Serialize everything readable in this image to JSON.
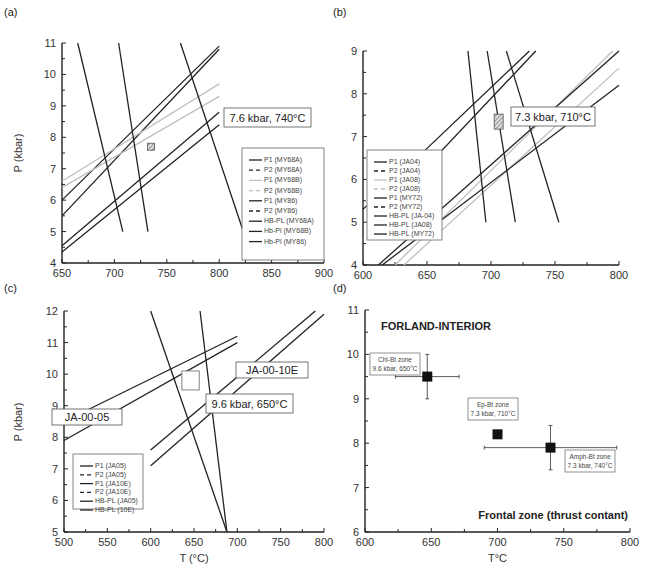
{
  "chart_data": [
    {
      "id": "a",
      "panel_label": "(a)",
      "type": "line",
      "xlabel": "",
      "ylabel": "P (kbar)",
      "xlim": [
        650,
        900
      ],
      "ylim": [
        4,
        11
      ],
      "xticks": [
        "650",
        "700",
        "750",
        "800",
        "850",
        "900"
      ],
      "yticks": [
        "4",
        "5",
        "6",
        "7",
        "8",
        "9",
        "10",
        "11"
      ],
      "annotation": "7.6 kbar, 740°C",
      "estimate_box": {
        "x": 735,
        "y": 7.7,
        "style": "hatched"
      },
      "legend": [
        "P1 (MY68A)",
        "P2 (MY68A)",
        "P1 (MY68B)",
        "P2 (MY68B)",
        "P1 (MY86)",
        "P2 (MY86)",
        "HB-PL (MY68A)",
        "Hb-Pl (MY68B)",
        "Hb-Pl (MY86)"
      ],
      "series": [
        {
          "name": "P1 (MY68A)",
          "x": [
            650,
            800
          ],
          "y": [
            6.0,
            10.9
          ],
          "color": "#222222"
        },
        {
          "name": "P2 (MY68A)",
          "x": [
            650,
            800
          ],
          "y": [
            5.5,
            10.8
          ],
          "color": "#222222"
        },
        {
          "name": "P1 (MY68B)",
          "x": [
            650,
            800
          ],
          "y": [
            6.6,
            9.7
          ],
          "color": "#c0c0c0"
        },
        {
          "name": "P2 (MY68B)",
          "x": [
            650,
            800
          ],
          "y": [
            6.4,
            9.3
          ],
          "color": "#c0c0c0"
        },
        {
          "name": "P1 (MY86)",
          "x": [
            650,
            800
          ],
          "y": [
            4.55,
            8.8
          ],
          "color": "#222222"
        },
        {
          "name": "P2 (MY86)",
          "x": [
            650,
            800
          ],
          "y": [
            4.35,
            8.4
          ],
          "color": "#222222"
        },
        {
          "name": "HB-PL (MY68A)",
          "x": [
            665,
            708
          ],
          "y": [
            11,
            5
          ],
          "color": "#222222"
        },
        {
          "name": "Hb-Pl (MY68B)",
          "x": [
            704,
            732
          ],
          "y": [
            11,
            5
          ],
          "color": "#222222"
        },
        {
          "name": "Hb-Pl (MY86)",
          "x": [
            763,
            823
          ],
          "y": [
            11,
            5
          ],
          "color": "#222222"
        }
      ]
    },
    {
      "id": "b",
      "panel_label": "(b)",
      "type": "line",
      "xlabel": "",
      "ylabel": "",
      "xlim": [
        600,
        800
      ],
      "ylim": [
        4,
        9
      ],
      "xticks": [
        "600",
        "650",
        "700",
        "750",
        "800"
      ],
      "yticks": [
        "4",
        "5",
        "6",
        "7",
        "8",
        "9"
      ],
      "annotation": "7.3 kbar, 710°C",
      "estimate_box": {
        "x": 706,
        "y": 7.35,
        "style": "hatched"
      },
      "legend": [
        "P1 (JA04)",
        "P2 (JA04)",
        "P1 (JA08)",
        "P2 (JA08)",
        "P1 (MY72)",
        "P2 (MY72)",
        "HB-PL (JA-04)",
        "HB-PL (JA08)",
        "HB-PL (MY72)"
      ],
      "series": [
        {
          "name": "P1 (JA04)",
          "x": [
            600,
            730
          ],
          "y": [
            5.3,
            9.0
          ],
          "color": "#222222"
        },
        {
          "name": "P2 (JA04)",
          "x": [
            615,
            735
          ],
          "y": [
            5.2,
            9.0
          ],
          "color": "#222222"
        },
        {
          "name": "P1 (JA08)",
          "x": [
            625,
            795
          ],
          "y": [
            4.0,
            9.0
          ],
          "color": "#c0c0c0"
        },
        {
          "name": "P2 (JA08)",
          "x": [
            632,
            800
          ],
          "y": [
            4.0,
            8.6
          ],
          "color": "#c0c0c0"
        },
        {
          "name": "P1 (MY72)",
          "x": [
            612,
            800
          ],
          "y": [
            4.0,
            9.0
          ],
          "color": "#222222"
        },
        {
          "name": "P2 (MY72)",
          "x": [
            615,
            800
          ],
          "y": [
            4.0,
            8.2
          ],
          "color": "#222222"
        },
        {
          "name": "HB-PL (JA-04)",
          "x": [
            682,
            696
          ],
          "y": [
            9,
            5
          ],
          "color": "#222222"
        },
        {
          "name": "HB-PL (JA08)",
          "x": [
            697,
            719
          ],
          "y": [
            9,
            5
          ],
          "color": "#222222"
        },
        {
          "name": "HB-PL (MY72)",
          "x": [
            712,
            753
          ],
          "y": [
            9,
            5
          ],
          "color": "#222222"
        }
      ]
    },
    {
      "id": "c",
      "panel_label": "(c)",
      "type": "line",
      "xlabel": "T (°C)",
      "ylabel": "P (kbar)",
      "xlim": [
        500,
        800
      ],
      "ylim": [
        5,
        12
      ],
      "xticks": [
        "500",
        "550",
        "600",
        "650",
        "700",
        "750",
        "800"
      ],
      "yticks": [
        "5",
        "6",
        "7",
        "8",
        "9",
        "10",
        "11",
        "12"
      ],
      "annotation": "9.6 kbar, 650°C",
      "sample_labels": [
        "JA-00-05",
        "JA-00-10E"
      ],
      "estimate_box": {
        "x": [
          636,
          656
        ],
        "y": [
          9.5,
          10.1
        ],
        "style": "open"
      },
      "legend": [
        "P1 (JA05)",
        "P2 (JA05)",
        "P1 (JA10E)",
        "P2 (JA10E)",
        "HB-PL (JA05)",
        "HB-PL (10E)"
      ],
      "series": [
        {
          "name": "P1 (JA05)",
          "x": [
            500,
            700
          ],
          "y": [
            8.5,
            11.2
          ],
          "color": "#222222"
        },
        {
          "name": "P2 (JA05)",
          "x": [
            500,
            700
          ],
          "y": [
            7.9,
            11.0
          ],
          "color": "#222222"
        },
        {
          "name": "P1 (JA10E)",
          "x": [
            600,
            790
          ],
          "y": [
            7.6,
            12.0
          ],
          "color": "#222222"
        },
        {
          "name": "P2 (JA10E)",
          "x": [
            600,
            800
          ],
          "y": [
            7.1,
            11.9
          ],
          "color": "#222222"
        },
        {
          "name": "HB-PL (JA05)",
          "x": [
            600,
            688
          ],
          "y": [
            12,
            5
          ],
          "color": "#222222"
        },
        {
          "name": "HB-PL (10E)",
          "x": [
            657,
            688
          ],
          "y": [
            12,
            5
          ],
          "color": "#222222"
        }
      ]
    },
    {
      "id": "d",
      "panel_label": "(d)",
      "type": "scatter",
      "xlabel": "T°C",
      "ylabel": "",
      "xlim": [
        600,
        800
      ],
      "ylim": [
        6,
        11
      ],
      "xticks": [
        "600",
        "650",
        "700",
        "750",
        "800"
      ],
      "yticks": [
        "6",
        "7",
        "8",
        "9",
        "10",
        "11"
      ],
      "title_top": "FORLAND-INTERIOR",
      "title_bottom": "Frontal zone (thrust contant)",
      "points": [
        {
          "label": "Chl-Bt zone",
          "sub": "9.6 kbar, 650°C",
          "x": 647,
          "y": 9.5,
          "xerr": [
            623,
            671
          ],
          "yerr": [
            9.0,
            10.0
          ]
        },
        {
          "label": "Ep-Bt zone",
          "sub": "7.3 kbar, 710°C",
          "x": 700,
          "y": 8.2,
          "xerr": null,
          "yerr": null
        },
        {
          "label": "Amph-Bt zone",
          "sub": "7.3 kbar, 740°C",
          "x": 740,
          "y": 7.9,
          "xerr": [
            690,
            790
          ],
          "yerr": [
            7.4,
            8.4
          ]
        }
      ]
    }
  ]
}
